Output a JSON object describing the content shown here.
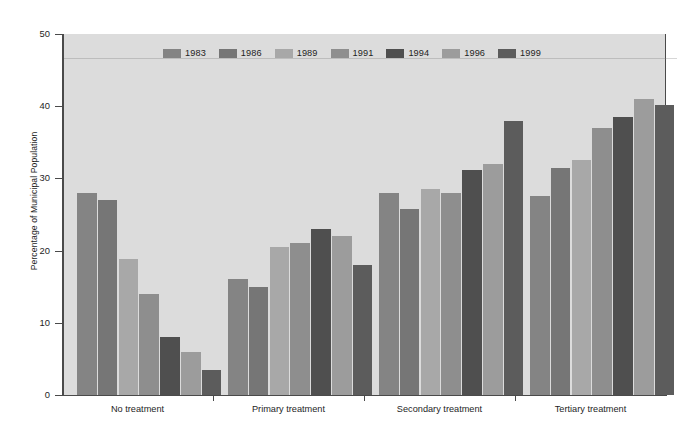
{
  "chart_data": {
    "type": "bar",
    "title": "",
    "subtitle": "",
    "xlabel": "",
    "ylabel": "Percentage of Municipal Population",
    "ylim": [
      0,
      50
    ],
    "yticks": [
      0,
      10,
      20,
      30,
      40,
      50
    ],
    "grid": false,
    "legend_position": "top-center",
    "categories": [
      "No treatment",
      "Primary treatment",
      "Secondary treatment",
      "Tertiary treatment"
    ],
    "series": [
      {
        "name": "1983",
        "color": "#848484",
        "values": [
          28.0,
          16.0,
          28.0,
          27.5
        ]
      },
      {
        "name": "1986",
        "color": "#767676",
        "values": [
          27.0,
          15.0,
          25.8,
          31.5
        ]
      },
      {
        "name": "1989",
        "color": "#a8a8a8",
        "values": [
          18.8,
          20.5,
          28.5,
          32.5
        ]
      },
      {
        "name": "1991",
        "color": "#8e8e8e",
        "values": [
          14.0,
          21.0,
          28.0,
          37.0
        ]
      },
      {
        "name": "1994",
        "color": "#4f4f4f",
        "values": [
          8.0,
          23.0,
          31.2,
          38.5
        ]
      },
      {
        "name": "1996",
        "color": "#9c9c9c",
        "values": [
          6.0,
          22.0,
          32.0,
          41.0
        ]
      },
      {
        "name": "1999",
        "color": "#5c5c5c",
        "values": [
          3.5,
          18.0,
          38.0,
          40.2
        ]
      }
    ]
  },
  "axis": {
    "y_tick_labels": [
      "0",
      "10",
      "20",
      "30",
      "40",
      "50"
    ],
    "y_axis_title": "Percentage of Municipal Population"
  },
  "legend": {
    "items": [
      {
        "label": "1983"
      },
      {
        "label": "1986"
      },
      {
        "label": "1989"
      },
      {
        "label": "1991"
      },
      {
        "label": "1994"
      },
      {
        "label": "1996"
      },
      {
        "label": "1999"
      }
    ]
  },
  "colors": {
    "plot_background": "#dcdcdc",
    "page_background": "#ffffff",
    "axis": "#4a4a4a",
    "text": "#1e1e1e"
  }
}
